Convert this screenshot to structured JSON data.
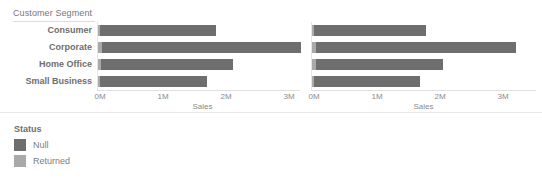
{
  "header": {
    "corner_label": "Customer Segment"
  },
  "legend": {
    "title": "Status",
    "items": [
      {
        "label": "Null",
        "color": "#6e6e6e"
      },
      {
        "label": "Returned",
        "color": "#a9a9a9"
      }
    ]
  },
  "axis": {
    "title": "Sales",
    "ticks": [
      "0M",
      "1M",
      "2M",
      "3M"
    ],
    "tick_values": [
      0,
      1000000,
      2000000,
      3000000
    ]
  },
  "chart_data": {
    "type": "bar",
    "orientation": "horizontal",
    "stacked": true,
    "title": "",
    "xlabel": "Sales",
    "ylabel": "Customer Segment",
    "xlim": [
      0,
      3220000
    ],
    "grid": false,
    "legend_position": "bottom-left",
    "categories": [
      "Consumer",
      "Corporate",
      "Home Office",
      "Small Business"
    ],
    "panels": [
      {
        "name": "panel-1",
        "xlabel": "Sales",
        "series": [
          {
            "name": "Returned",
            "color": "#a9a9a9",
            "values": [
              20000,
              60000,
              55000,
              25000
            ]
          },
          {
            "name": "Null",
            "color": "#6e6e6e",
            "values": [
              1845000,
              3160000,
              2090000,
              1710000
            ]
          }
        ],
        "totals": [
          1865000,
          3220000,
          2145000,
          1735000
        ]
      },
      {
        "name": "panel-2",
        "xlabel": "Sales",
        "series": [
          {
            "name": "Returned",
            "color": "#a9a9a9",
            "values": [
              25000,
              70000,
              60000,
              30000
            ]
          },
          {
            "name": "Null",
            "color": "#6e6e6e",
            "values": [
              1780000,
              3175000,
              2020000,
              1690000
            ]
          }
        ],
        "totals": [
          1805000,
          3245000,
          2080000,
          1720000
        ]
      }
    ]
  }
}
